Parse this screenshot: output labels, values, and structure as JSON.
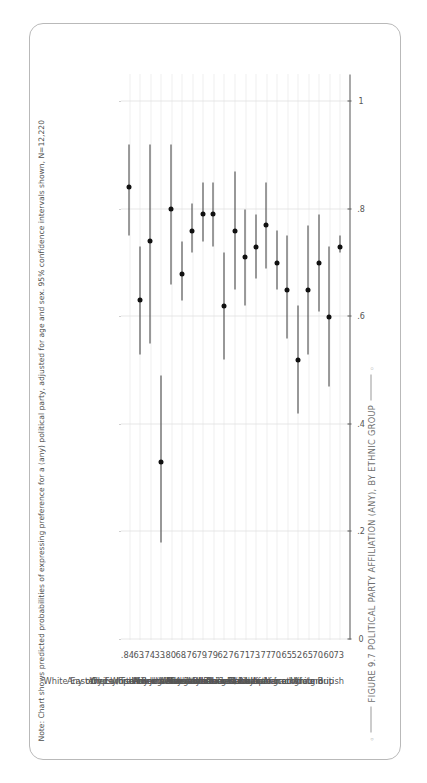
{
  "figure": {
    "title": "FIGURE 9.7 POLITICAL PARTY AFFILIATION (ANY), BY ETHNIC GROUP",
    "note": "Note: Chart shows predicted probabilities of expressing preference for a (any) political party, adjusted for age and sex. 95% confidence intervals shown, N=12,220"
  },
  "chart_data": {
    "type": "scatter",
    "title": "FIGURE 9.7 POLITICAL PARTY AFFILIATION (ANY), BY ETHNIC GROUP",
    "orientation": "horizontal-dot-whisker",
    "xlabel": "",
    "ylabel": "",
    "xlim": [
      0,
      1.05
    ],
    "xticks": [
      0,
      0.2,
      0.4,
      0.6,
      0.8,
      1
    ],
    "xtick_labels": [
      "0",
      ".2",
      ".4",
      ".6",
      ".8",
      "1"
    ],
    "grid": true,
    "legend": "none",
    "categories": [
      "White Irish",
      "White Eastern European",
      "Gypsy/Traveller",
      "Roma",
      "Jewish",
      "Any other White background",
      "Indian",
      "Pakistani",
      "Bangladeshi",
      "Mixed White and Asian",
      "Chinese",
      "Any other Asian background",
      "Black Caribbean",
      "Mixed White and Black Caribbean",
      "Black African",
      "Mixed White and Black African",
      "Any other Black background",
      "Arab",
      "Any other mixed/multiple background",
      "Any other ethnic group",
      "White British"
    ],
    "value_labels": [
      ".84",
      ".63",
      ".74",
      ".33",
      ".80",
      ".68",
      ".76",
      ".79",
      ".79",
      ".62",
      ".76",
      ".71",
      ".73",
      ".77",
      ".70",
      ".65",
      ".52",
      ".65",
      ".70",
      ".60",
      ".73"
    ],
    "values": [
      0.84,
      0.63,
      0.74,
      0.33,
      0.8,
      0.68,
      0.76,
      0.79,
      0.79,
      0.62,
      0.76,
      0.71,
      0.73,
      0.77,
      0.7,
      0.65,
      0.52,
      0.65,
      0.7,
      0.6,
      0.73
    ],
    "ci_low": [
      0.75,
      0.53,
      0.55,
      0.18,
      0.66,
      0.63,
      0.72,
      0.74,
      0.73,
      0.52,
      0.65,
      0.62,
      0.67,
      0.69,
      0.65,
      0.56,
      0.42,
      0.53,
      0.61,
      0.47,
      0.72
    ],
    "ci_high": [
      0.92,
      0.73,
      0.92,
      0.49,
      0.92,
      0.74,
      0.81,
      0.85,
      0.85,
      0.72,
      0.87,
      0.8,
      0.79,
      0.85,
      0.76,
      0.75,
      0.62,
      0.77,
      0.79,
      0.73,
      0.75
    ]
  }
}
